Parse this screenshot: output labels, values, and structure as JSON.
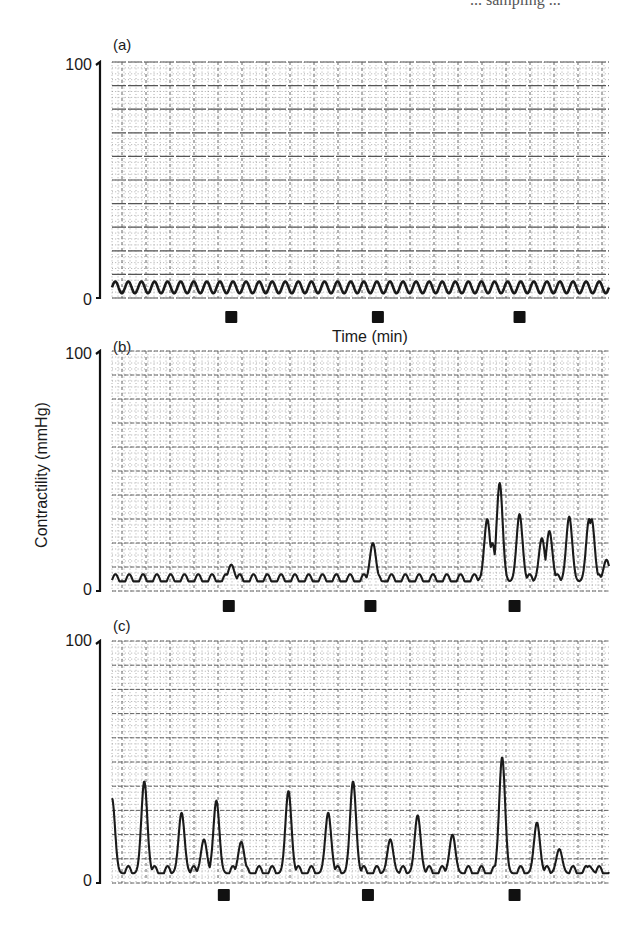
{
  "header_fragment": "... sampling ...",
  "figure": {
    "ylabel": "Contractility (mmHg)",
    "xlabel": "Time (min)",
    "panels": [
      {
        "id": "a",
        "label": "(a)",
        "ytick_top": "100",
        "ytick_bottom": "0"
      },
      {
        "id": "b",
        "label": "(b)",
        "ytick_top": "100",
        "ytick_bottom": "0"
      },
      {
        "id": "c",
        "label": "(c)",
        "ytick_top": "100",
        "ytick_bottom": "0"
      }
    ]
  },
  "chart_data": [
    {
      "type": "line",
      "title": "(a)",
      "xlabel": "Time (min)",
      "ylabel": "Contractility (mmHg)",
      "ylim": [
        0,
        100
      ],
      "grid": true,
      "description": "Regular low-amplitude rhythmic contractions (~2-7 mmHg) throughout; no response at stimulus markers",
      "markers_x_fraction": [
        0.24,
        0.535,
        0.82
      ],
      "series": [
        {
          "name": "trace",
          "baseline": 2,
          "amplitude": 5,
          "cycles": 38,
          "peaks": []
        }
      ]
    },
    {
      "type": "line",
      "title": "(b)",
      "xlabel": "Time (min)",
      "ylabel": "Contractility (mmHg)",
      "ylim": [
        0,
        100
      ],
      "grid": true,
      "description": "Low-amplitude rhythm with small spikes at first two markers, irregular large contractions after third marker",
      "markers_x_fraction": [
        0.235,
        0.52,
        0.81
      ],
      "series": [
        {
          "name": "trace",
          "baseline": 2,
          "amplitude": 5,
          "cycles": 36,
          "peaks": [
            {
              "x": 0.24,
              "y": 11
            },
            {
              "x": 0.525,
              "y": 20
            },
            {
              "x": 0.75,
              "y": 10
            },
            {
              "x": 0.755,
              "y": 30
            },
            {
              "x": 0.765,
              "y": 20
            },
            {
              "x": 0.78,
              "y": 45
            },
            {
              "x": 0.82,
              "y": 32
            },
            {
              "x": 0.865,
              "y": 22
            },
            {
              "x": 0.88,
              "y": 25
            },
            {
              "x": 0.92,
              "y": 31
            },
            {
              "x": 0.96,
              "y": 30
            },
            {
              "x": 0.965,
              "y": 30
            },
            {
              "x": 0.995,
              "y": 13
            }
          ]
        }
      ]
    },
    {
      "type": "line",
      "title": "(c)",
      "xlabel": "Time (min)",
      "ylabel": "Contractility (mmHg)",
      "ylim": [
        0,
        100
      ],
      "grid": true,
      "description": "Low-amplitude rhythm with recurrent large phasic contractions",
      "markers_x_fraction": [
        0.225,
        0.515,
        0.81
      ],
      "series": [
        {
          "name": "trace",
          "baseline": 2,
          "amplitude": 5,
          "cycles": 38,
          "peaks": [
            {
              "x": 0.0,
              "y": 35
            },
            {
              "x": 0.065,
              "y": 42
            },
            {
              "x": 0.14,
              "y": 29
            },
            {
              "x": 0.185,
              "y": 18
            },
            {
              "x": 0.21,
              "y": 34
            },
            {
              "x": 0.26,
              "y": 17
            },
            {
              "x": 0.355,
              "y": 38
            },
            {
              "x": 0.435,
              "y": 29
            },
            {
              "x": 0.485,
              "y": 42
            },
            {
              "x": 0.56,
              "y": 18
            },
            {
              "x": 0.615,
              "y": 28
            },
            {
              "x": 0.685,
              "y": 20
            },
            {
              "x": 0.785,
              "y": 52
            },
            {
              "x": 0.855,
              "y": 25
            },
            {
              "x": 0.9,
              "y": 14
            },
            {
              "x": 0.96,
              "y": 7
            }
          ]
        }
      ]
    }
  ],
  "layout": {
    "plot_x0": 112,
    "plot_x1": 609,
    "panels_px": [
      {
        "top": 62,
        "bottom": 298,
        "marker_y": 317
      },
      {
        "top": 351,
        "bottom": 591,
        "marker_y": 606
      },
      {
        "top": 641,
        "bottom": 883,
        "marker_y": 895
      }
    ],
    "trace_color": "#1a1a1a",
    "grid_major_color": "#555555",
    "grid_minor_color": "#9a9a9a"
  }
}
